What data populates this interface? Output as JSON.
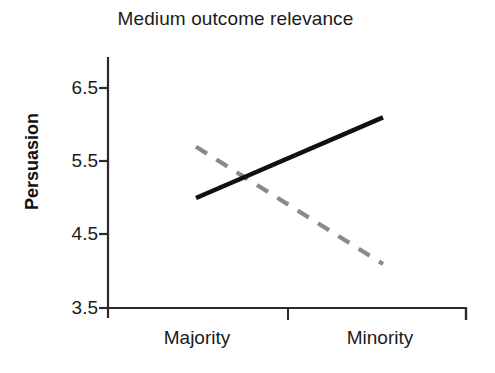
{
  "chart_data": {
    "type": "line",
    "title": "Medium outcome relevance",
    "xlabel": "",
    "ylabel": "Persuasion",
    "categories": [
      "Majority",
      "Minority"
    ],
    "x": [
      0,
      1
    ],
    "ylim": [
      3.5,
      6.5
    ],
    "yticks": [
      3.5,
      4.5,
      5.5,
      6.5
    ],
    "ytick_labels": [
      "3.5",
      "4.5",
      "5.5",
      "6.5"
    ],
    "grid": false,
    "legend": "none",
    "series": [
      {
        "name": "solid-series",
        "style": "solid",
        "color": "#101010",
        "values": [
          5.0,
          6.1
        ]
      },
      {
        "name": "dashed-series",
        "style": "dashed",
        "color": "#8a8a8a",
        "values": [
          5.7,
          4.1
        ]
      }
    ]
  },
  "axes": {
    "y_tick_0": "3.5",
    "y_tick_1": "4.5",
    "y_tick_2": "5.5",
    "y_tick_3": "6.5",
    "x_tick_0": "Majority",
    "x_tick_1": "Minority"
  },
  "colors": {
    "axis": "#2a2a2a",
    "solid_line": "#101010",
    "dashed_line": "#8a8a8a",
    "text": "#1b1b1b",
    "background": "#ffffff"
  }
}
